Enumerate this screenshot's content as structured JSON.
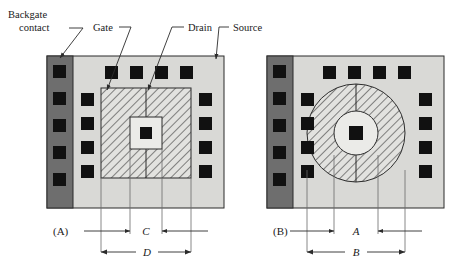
{
  "figure": {
    "caption_labels": {
      "panel_a": "(A)",
      "panel_b": "(B)"
    },
    "callouts": [
      {
        "id": "backgate",
        "line1": "Backgate",
        "line2": "contact"
      },
      {
        "id": "gate",
        "line1": "Gate",
        "line2": ""
      },
      {
        "id": "drain",
        "line1": "Drain",
        "line2": ""
      },
      {
        "id": "source",
        "line1": "Source",
        "line2": ""
      }
    ],
    "dimensions": {
      "panel_a_inner": "C",
      "panel_a_outer": "D",
      "panel_b_inner": "A",
      "panel_b_outer": "B"
    },
    "colors": {
      "die_body": "#d9d9d6",
      "backgate_strip": "#6e6e6e",
      "pad": "#111111",
      "outline": "#2b2b2b",
      "hatch": "#333333",
      "hatch_fill": "#e2e2df",
      "center_fill": "#ebebe8",
      "leader": "#2b2b2b",
      "background": "#ffffff"
    },
    "panel_a": {
      "shape": "square-gate",
      "backgate_pad_count": 5,
      "top_pad_count": 4,
      "left_pad_count": 4,
      "right_pad_count": 4,
      "center_pad_count": 1
    },
    "panel_b": {
      "shape": "circular-gate",
      "backgate_pad_count": 5,
      "top_pad_count": 4,
      "left_pad_count": 4,
      "right_pad_count": 4,
      "center_pad_count": 1
    }
  }
}
